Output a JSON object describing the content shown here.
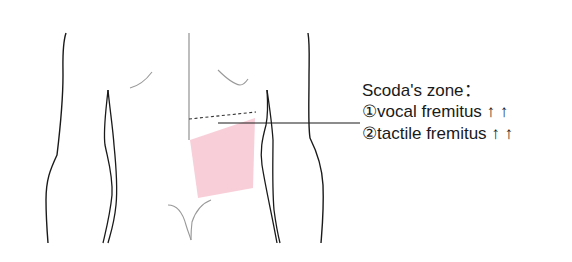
{
  "diagram": {
    "title": "Scoda's zone：",
    "items": [
      {
        "marker": "①",
        "text": "vocal fremitus",
        "arrows": "↑ ↑"
      },
      {
        "marker": "②",
        "text": "tactile fremitus",
        "arrows": "↑ ↑"
      }
    ],
    "colors": {
      "outline": "#1a1a1a",
      "light_outline": "#9a9a9a",
      "zone_fill": "#f7c6d2"
    }
  }
}
